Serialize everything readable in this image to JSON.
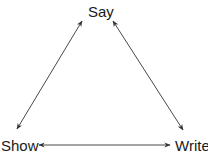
{
  "diagram": {
    "type": "triangle-relationship",
    "nodes": [
      {
        "id": "say",
        "label": "Say"
      },
      {
        "id": "show",
        "label": "Show"
      },
      {
        "id": "write",
        "label": "Write"
      }
    ],
    "edges": [
      {
        "from": "say",
        "to": "show",
        "direction": "bidirectional"
      },
      {
        "from": "say",
        "to": "write",
        "direction": "bidirectional"
      },
      {
        "from": "show",
        "to": "write",
        "direction": "bidirectional"
      }
    ],
    "colors": {
      "line": "#333333",
      "text": "#1a1a1a",
      "background": "#ffffff"
    }
  }
}
